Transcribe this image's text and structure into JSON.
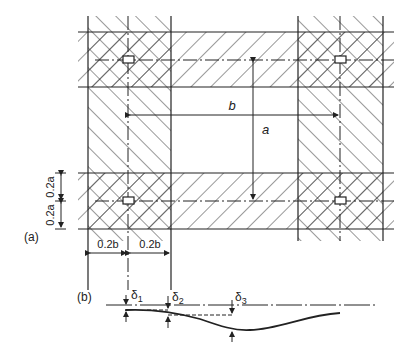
{
  "figure": {
    "part_a": {
      "label": "(a)",
      "dim_b": "b",
      "dim_a": "a",
      "dim_vertical": [
        "0.2a",
        "0.2a"
      ],
      "dim_horizontal": [
        "0.2b",
        "0.2b"
      ]
    },
    "part_b": {
      "label": "(b)",
      "deltas": [
        {
          "sym": "δ",
          "sub": "1"
        },
        {
          "sym": "δ",
          "sub": "2"
        },
        {
          "sym": "δ",
          "sub": "3"
        }
      ]
    },
    "colors": {
      "line": "#222222",
      "background": "#ffffff"
    }
  }
}
